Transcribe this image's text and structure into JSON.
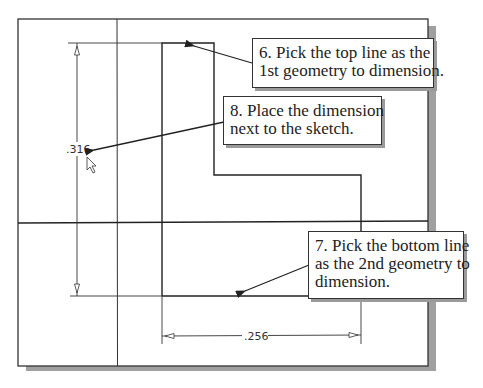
{
  "diagram": {
    "type": "cad-sketch-dimensioning",
    "colors": {
      "line": "#2a2a2a",
      "shadow": "#9a9a9a",
      "background": "#ffffff"
    },
    "dimensions": {
      "vertical": {
        "value": ".316"
      },
      "horizontal": {
        "value": ".256"
      }
    },
    "callouts": [
      {
        "step": "6",
        "lines": [
          "6. Pick the top line as the",
          "1st geometry to dimension."
        ]
      },
      {
        "step": "8",
        "lines": [
          "8. Place the dimension",
          "next to the sketch."
        ]
      },
      {
        "step": "7",
        "lines": [
          "7. Pick the bottom line",
          "as the 2nd geometry to",
          "dimension."
        ]
      }
    ],
    "cursor": {
      "icon": "arrow-cursor-icon"
    }
  }
}
